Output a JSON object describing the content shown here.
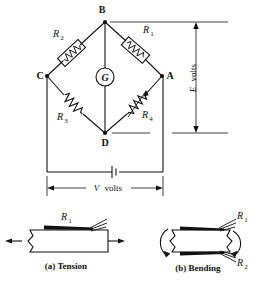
{
  "figure": {
    "circuit": {
      "nodes": [
        {
          "id": "B",
          "label": "B",
          "x": 105,
          "y": 22
        },
        {
          "id": "C",
          "label": "C",
          "x": 47,
          "y": 76
        },
        {
          "id": "A",
          "label": "A",
          "x": 162,
          "y": 76
        },
        {
          "id": "D",
          "label": "D",
          "x": 105,
          "y": 133
        }
      ],
      "resistors": [
        {
          "id": "R1",
          "label": "R",
          "sub": "1",
          "branch": "B-A",
          "variable": false
        },
        {
          "id": "R2",
          "label": "R",
          "sub": "2",
          "branch": "B-C",
          "variable": false
        },
        {
          "id": "R3",
          "label": "R",
          "sub": "3",
          "branch": "C-D",
          "variable": false
        },
        {
          "id": "R4",
          "label": "R",
          "sub": "4",
          "branch": "A-D",
          "variable": true
        }
      ],
      "meter": {
        "id": "G",
        "label": "G",
        "type": "galvanometer"
      },
      "source": {
        "type": "battery",
        "label": "battery-symbol"
      },
      "dimensions": [
        {
          "id": "E",
          "symbol": "E",
          "unit": "volts",
          "text": "E volts",
          "orientation": "vertical",
          "between": "B-D"
        },
        {
          "id": "V",
          "symbol": "V",
          "unit": "volts",
          "text": "V volts",
          "orientation": "horizontal",
          "between": "C-A supply rail"
        }
      ]
    },
    "beams": [
      {
        "id": "a",
        "caption": "(a) Tension",
        "gauges": [
          {
            "label": "R",
            "sub": "1",
            "position": "top"
          }
        ],
        "arrows": [
          "left",
          "right"
        ]
      },
      {
        "id": "b",
        "caption": "(b) Bending",
        "gauges": [
          {
            "label": "R",
            "sub": "1",
            "position": "top"
          },
          {
            "label": "R",
            "sub": "2",
            "position": "bottom"
          }
        ],
        "arrows": [
          "curved-left",
          "curved-right"
        ]
      }
    ],
    "colors": {
      "ink": "#111111",
      "paper": "#ffffff"
    }
  }
}
